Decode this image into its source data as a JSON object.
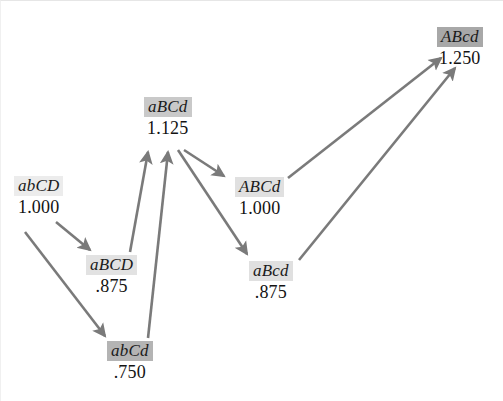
{
  "figure": {
    "kind": "fitness-landscape-adaptive-walk-diagram",
    "background": "#ffffff",
    "arrow_color": "#7a7a7a"
  },
  "nodes": [
    {
      "id": "abCD",
      "genotype": "abCD",
      "fitness": "1.000",
      "highlight": "#ececec",
      "x": 14,
      "y": 176
    },
    {
      "id": "aBCD",
      "genotype": "aBCD",
      "fitness": ".875",
      "highlight": "#e2e2e2",
      "x": 86,
      "y": 255
    },
    {
      "id": "abCd",
      "genotype": "abCd",
      "fitness": ".750",
      "highlight": "#b4b4b4",
      "x": 107,
      "y": 341
    },
    {
      "id": "aBCd",
      "genotype": "aBCd",
      "fitness": "1.125",
      "highlight": "#c9c9c9",
      "x": 144,
      "y": 97
    },
    {
      "id": "ABCd",
      "genotype": "ABCd",
      "fitness": "1.000",
      "highlight": "#e0e0e0",
      "x": 235,
      "y": 177
    },
    {
      "id": "aBcd",
      "genotype": "aBcd",
      "fitness": ".875",
      "highlight": "#e0e0e0",
      "x": 249,
      "y": 261
    },
    {
      "id": "ABcd",
      "genotype": "ABcd",
      "fitness": "1.250",
      "highlight": "#a8a8a8",
      "x": 437,
      "y": 27
    }
  ],
  "chart_data": {
    "type": "diagram",
    "title": "",
    "nodes": [
      {
        "label": "abCD",
        "value": 1.0
      },
      {
        "label": "aBCD",
        "value": 0.875
      },
      {
        "label": "abCd",
        "value": 0.75
      },
      {
        "label": "aBCd",
        "value": 1.125
      },
      {
        "label": "ABCd",
        "value": 1.0
      },
      {
        "label": "aBcd",
        "value": 0.875
      },
      {
        "label": "ABcd",
        "value": 1.25
      }
    ],
    "edges": [
      {
        "from": "abCD",
        "to": "aBCD"
      },
      {
        "from": "abCD",
        "to": "abCd"
      },
      {
        "from": "aBCD",
        "to": "aBCd"
      },
      {
        "from": "abCd",
        "to": "aBCd"
      },
      {
        "from": "aBCd",
        "to": "ABCd"
      },
      {
        "from": "aBCd",
        "to": "aBcd"
      },
      {
        "from": "ABCd",
        "to": "ABcd"
      },
      {
        "from": "aBcd",
        "to": "ABcd"
      }
    ]
  },
  "edges": [
    {
      "id": "abCD-to-aBCD",
      "x1": 56,
      "y1": 222,
      "x2": 90,
      "y2": 250
    },
    {
      "id": "abCD-to-abCd",
      "x1": 25,
      "y1": 232,
      "x2": 105,
      "y2": 336
    },
    {
      "id": "aBCD-to-aBCd",
      "x1": 130,
      "y1": 252,
      "x2": 148,
      "y2": 152
    },
    {
      "id": "abCd-to-aBCd",
      "x1": 148,
      "y1": 338,
      "x2": 168,
      "y2": 152
    },
    {
      "id": "aBCd-to-ABCd",
      "x1": 184,
      "y1": 150,
      "x2": 224,
      "y2": 176
    },
    {
      "id": "aBCd-to-aBcd",
      "x1": 178,
      "y1": 150,
      "x2": 247,
      "y2": 254
    },
    {
      "id": "ABCd-to-ABcd",
      "x1": 288,
      "y1": 178,
      "x2": 441,
      "y2": 58
    },
    {
      "id": "aBcd-to-ABcd",
      "x1": 299,
      "y1": 260,
      "x2": 455,
      "y2": 68
    }
  ]
}
